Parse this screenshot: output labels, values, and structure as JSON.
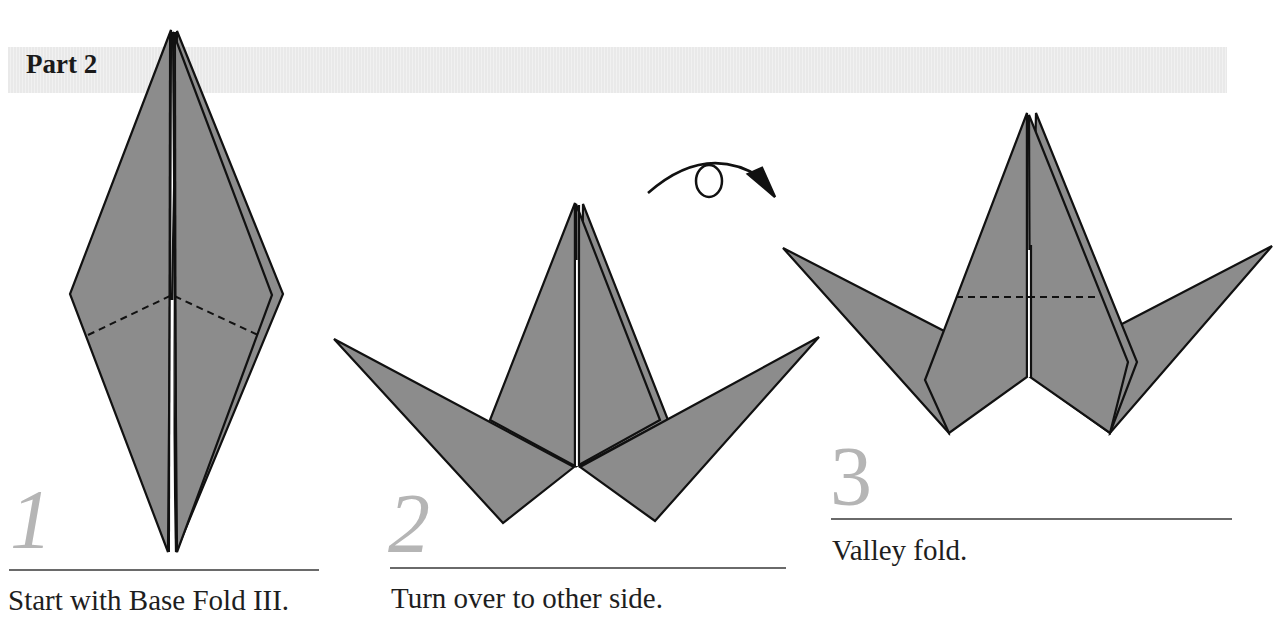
{
  "section": {
    "title": "Part 2"
  },
  "colors": {
    "paper": "#8c8c8c",
    "outline": "#111111",
    "step_number": "#b5b5b5",
    "rule": "#6a6a6a",
    "header_bar": "#ececec"
  },
  "steps": [
    {
      "number": "1",
      "caption": "Start with Base Fold III."
    },
    {
      "number": "2",
      "caption": "Turn over to other side.",
      "symbol": "turn-over-arrow-icon"
    },
    {
      "number": "3",
      "caption": "Valley fold."
    }
  ]
}
